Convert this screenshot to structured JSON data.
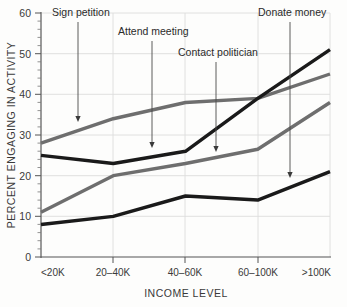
{
  "chart_data": {
    "type": "line",
    "title": "",
    "xlabel": "INCOME LEVEL",
    "ylabel": "PERCENT ENGAGING IN ACTIVITY",
    "categories": [
      "<20K",
      "20–40K",
      "40–60K",
      "60–100K",
      ">100K"
    ],
    "ylim": [
      0,
      60
    ],
    "yticks": [
      0,
      10,
      20,
      30,
      40,
      50,
      60
    ],
    "ytick_labels": [
      "0",
      "10",
      "20",
      "30",
      "40",
      "50",
      "60"
    ],
    "grid": true,
    "legend": "none (inline arrow annotations)",
    "series": [
      {
        "name": "Sign petition",
        "color": "#6e6e6e",
        "values": [
          28,
          34,
          38,
          39,
          45
        ]
      },
      {
        "name": "Attend meeting",
        "color": "#1a1a1a",
        "values": [
          25,
          23,
          26,
          39,
          51
        ]
      },
      {
        "name": "Contact politician",
        "color": "#6e6e6e",
        "values": [
          11,
          20,
          23,
          26.5,
          38
        ]
      },
      {
        "name": "Donate money",
        "color": "#1a1a1a",
        "values": [
          8,
          10,
          15,
          14,
          21
        ]
      }
    ],
    "annotations": [
      {
        "label": "Sign petition",
        "target_series": "Sign petition",
        "label_x": 52,
        "label_y": 16,
        "arrow_x": 78,
        "arrow_y_start": 22,
        "arrow_y_end": 122
      },
      {
        "label": "Attend meeting",
        "target_series": "Attend meeting",
        "label_x": 118,
        "label_y": 35,
        "arrow_x": 152,
        "arrow_y_start": 41,
        "arrow_y_end": 148
      },
      {
        "label": "Contact politician",
        "target_series": "Contact politician",
        "label_x": 178,
        "label_y": 56,
        "arrow_x": 216,
        "arrow_y_start": 62,
        "arrow_y_end": 152
      },
      {
        "label": "Donate money",
        "target_series": "Donate money",
        "label_x": 258,
        "label_y": 16,
        "arrow_x": 290,
        "arrow_y_start": 22,
        "arrow_y_end": 178
      }
    ]
  },
  "axes": {
    "y_title": "PERCENT ENGAGING IN ACTIVITY",
    "x_title": "INCOME LEVEL",
    "y_labels": [
      "60",
      "50",
      "40",
      "30",
      "20",
      "10",
      "0"
    ],
    "x_labels": [
      "<20K",
      "20–40K",
      "40–60K",
      "60–100K",
      ">100K"
    ]
  },
  "colors": {
    "gray_series": "#6e6e6e",
    "black_series": "#1a1a1a",
    "grid": "#dcdcdc",
    "axis": "#555555",
    "text": "#3a3a3a",
    "background": "#fdfdfc"
  }
}
